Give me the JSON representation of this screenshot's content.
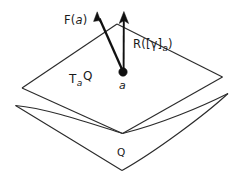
{
  "figure": {
    "type": "geometric-diagram",
    "background_color": "#ffffff",
    "line_color": "#2b2b2b",
    "vector_color": "#111111",
    "labels": {
      "vector_f": {
        "head": "F(",
        "arg": "a",
        "tail": ")"
      },
      "vector_r": {
        "head": "R([",
        "gamma": "γ",
        "bracket": "]",
        "sub": "a",
        "tail": ")"
      },
      "tangent_plane": {
        "head": "T",
        "sub": "a",
        "tail": "Q"
      },
      "point": {
        "text": "a"
      },
      "manifold": {
        "text": "Q"
      }
    },
    "geometry": {
      "tangent_plane_vertices": [
        [
          117,
          24
        ],
        [
          222,
          77
        ],
        [
          122,
          133
        ],
        [
          22,
          88
        ]
      ],
      "manifold_left_vertex": [
        15,
        105
      ],
      "manifold_right_vertex": [
        228,
        93
      ],
      "manifold_bottom_cusp": [
        122,
        170
      ],
      "point_a": [
        123,
        72
      ],
      "point_radius": 4.2,
      "vector_f_tip": [
        97,
        13
      ],
      "vector_r_tip": [
        124,
        13
      ]
    }
  }
}
